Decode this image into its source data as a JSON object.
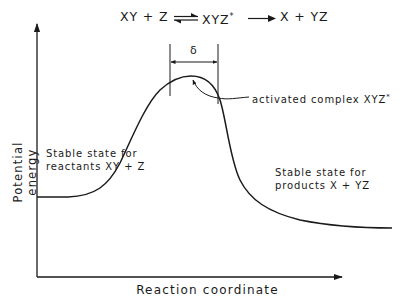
{
  "diagram": {
    "type": "potential-energy-reaction-coordinate",
    "equation": {
      "reactants": "XY + Z",
      "equilibrium_arrow": "⇌",
      "activated_complex": "XYZ",
      "activated_complex_superscript": "*",
      "forward_arrow": "⟶",
      "products": "X + YZ"
    },
    "axes": {
      "x_label": "Reaction coordinate",
      "y_label": "Potential energy"
    },
    "annotations": {
      "delta_symbol": "δ",
      "activated_complex_label": "activated complex  XYZ",
      "activated_complex_label_sup": "*",
      "reactants_line1": "Stable state for",
      "reactants_line2": "reactants  XY + Z",
      "products_line1": "Stable state for",
      "products_line2": "products   X + YZ"
    },
    "curve": {
      "description": "Energy profile: flat reactant plateau, rises to single maximum (activated complex), falls to lower product plateau",
      "points_px": [
        [
          37,
          197
        ],
        [
          70,
          196
        ],
        [
          100,
          188
        ],
        [
          120,
          165
        ],
        [
          140,
          122
        ],
        [
          160,
          92
        ],
        [
          180,
          78
        ],
        [
          191,
          76
        ],
        [
          205,
          80
        ],
        [
          218,
          98
        ],
        [
          225,
          130
        ],
        [
          235,
          170
        ],
        [
          250,
          198
        ],
        [
          270,
          212
        ],
        [
          300,
          221
        ],
        [
          340,
          226
        ],
        [
          392,
          228
        ]
      ],
      "reactant_level": "higher",
      "product_level": "lower"
    },
    "colors": {
      "ink": "#1a1a1a",
      "background": "#ffffff"
    }
  }
}
